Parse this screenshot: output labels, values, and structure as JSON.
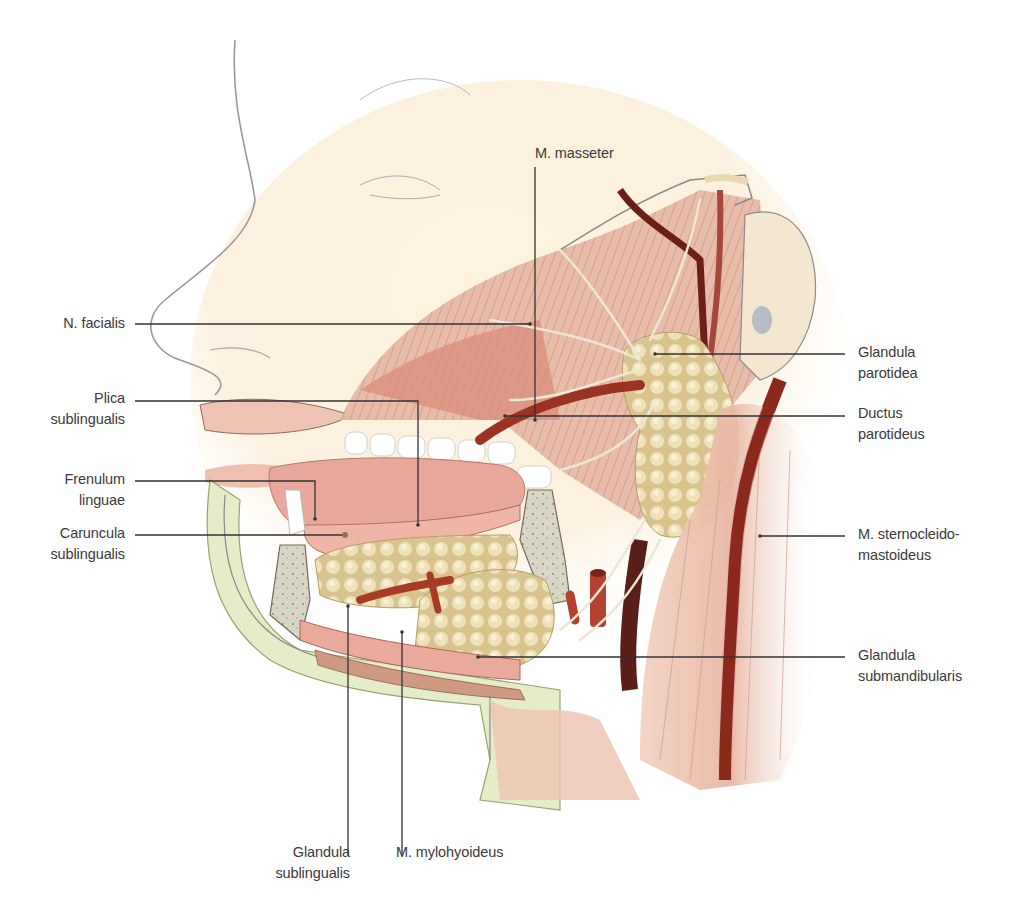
{
  "diagram": {
    "colors": {
      "skin_line": "#8a8a8a",
      "muscle": "#e3b4a0",
      "muscle_dark": "#c98a76",
      "gland": "#e6d6a6",
      "gland_shadow": "#bfa874",
      "artery": "#9a3322",
      "vein_dark": "#5a1f18",
      "nerve": "#ece8d6",
      "bone": "#d9d6c6",
      "tongue": "#e7a79a",
      "teeth": "#ffffff",
      "leader_line": "#333333",
      "skin_highlight": "#fbeed6"
    },
    "labels_left": [
      {
        "lines": [
          "N. facialis"
        ]
      },
      {
        "lines": [
          "Plica",
          "sublingualis"
        ]
      },
      {
        "lines": [
          "Frenulum",
          "linguae"
        ]
      },
      {
        "lines": [
          "Caruncula",
          "sublingualis"
        ]
      }
    ],
    "labels_top": [
      {
        "lines": [
          "M. masseter"
        ]
      }
    ],
    "labels_right": [
      {
        "lines": [
          "Glandula",
          "parotidea"
        ]
      },
      {
        "lines": [
          "Ductus",
          "parotideus"
        ]
      },
      {
        "lines": [
          "M. sternocleido-",
          "mastoideus"
        ]
      },
      {
        "lines": [
          "Glandula",
          "submandibularis"
        ]
      }
    ],
    "labels_bottom": [
      {
        "lines": [
          "Glandula",
          "sublingualis"
        ]
      },
      {
        "lines": [
          "M. mylohyoideus"
        ]
      }
    ]
  }
}
